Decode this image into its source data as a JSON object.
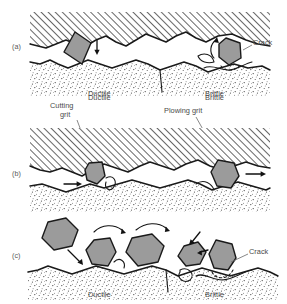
{
  "figure": {
    "background": "#ffffff",
    "ink_color": "#1a1a1a",
    "grit_fill": "#9b9b9b",
    "label_color": "#4a4a4a"
  },
  "panels": [
    {
      "id": "a",
      "label": "(a)",
      "description": "Grit wedged between hatched wheel bond above and stippled workpiece below; ductile side at left, brittle side at right with crack.",
      "labels": {
        "crack": "Crack",
        "ductile": "Ductile",
        "brittle": "Brittle"
      }
    },
    {
      "id": "b",
      "label": "(b)",
      "description": "Cutting grit at left producing a chip, plowing grit at right pushing material; arrows indicate direction of motion.",
      "labels": {
        "cutting_grit_line1": "Cutting",
        "cutting_grit_line2": "grit",
        "plowing_grit": "Plowing grit",
        "ductile": "Ductile",
        "brittle": "Brittle"
      }
    },
    {
      "id": "c",
      "label": "(c)",
      "description": "Free loose grits tumbling and rolling across the stippled surface; ductile side left, brittle side right with crack.",
      "labels": {
        "crack": "Crack",
        "ductile": "Ductile",
        "brittle": "Brittle"
      }
    }
  ],
  "legend_terms": {
    "ductile": "Ductile",
    "brittle": "Brittle",
    "crack": "Crack",
    "cutting_grit": "Cutting grit",
    "plowing_grit": "Plowing grit"
  }
}
